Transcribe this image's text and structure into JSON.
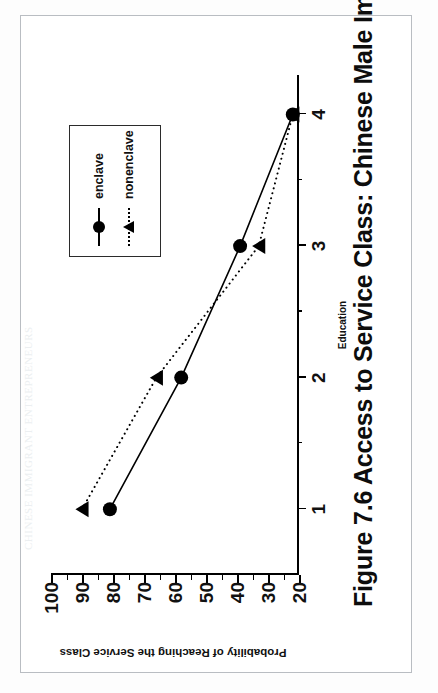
{
  "page": {
    "bleed_through_text": "CHINESE IMMIGRANT ENTREPRENEURS"
  },
  "figure": {
    "caption": "Figure 7.6 Access to Service Class: Chinese Male Immigrants",
    "legend": {
      "entries": [
        {
          "label": "enclave",
          "marker": "filled-circle",
          "line": "solid"
        },
        {
          "label": "nonenclave",
          "marker": "filled-triangle",
          "line": "dotted"
        }
      ]
    }
  },
  "chart_data": {
    "type": "line",
    "title": "Figure 7.6 Access to Service Class: Chinese Male Immigrants",
    "xlabel": "Education",
    "ylabel": "Probability of Reaching the Service Class",
    "x": [
      1,
      2,
      3,
      4
    ],
    "xtick_labels": [
      "1",
      "2",
      "3",
      "4"
    ],
    "ytick_labels": [
      "100",
      "90",
      "80",
      "70",
      "60",
      "50",
      "40",
      "30",
      "20"
    ],
    "ytick_values": [
      100,
      90,
      80,
      70,
      60,
      50,
      40,
      30,
      20
    ],
    "ylim": [
      20,
      100
    ],
    "xlim": [
      0.5,
      4.3
    ],
    "grid": false,
    "legend_position": "top-right",
    "series": [
      {
        "name": "enclave",
        "marker": "filled-circle",
        "line": "solid",
        "values": [
          81,
          58,
          39,
          22
        ]
      },
      {
        "name": "nonenclave",
        "marker": "filled-triangle",
        "line": "dotted",
        "values": [
          90,
          66,
          33,
          22
        ]
      }
    ]
  }
}
